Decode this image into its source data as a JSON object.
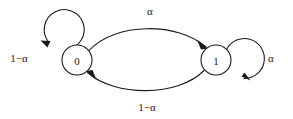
{
  "diagram": {
    "type": "state-transition-diagram",
    "title": "",
    "background_color": "#ffffff",
    "stroke_color": "#1a1a1a",
    "states": [
      {
        "id": "state-0",
        "label": "0",
        "cx": 77,
        "cy": 60,
        "r": 15
      },
      {
        "id": "state-1",
        "label": "1",
        "cx": 216,
        "cy": 60,
        "r": 15
      }
    ],
    "transitions": [
      {
        "id": "transition-0-to-1",
        "from": "0",
        "to": "1",
        "label": "α",
        "label_x": 150,
        "label_y": 11,
        "shape": "upper-arc"
      },
      {
        "id": "transition-1-to-0",
        "from": "1",
        "to": "0",
        "label": "1−α",
        "label_x": 147,
        "label_y": 107,
        "shape": "lower-arc"
      },
      {
        "id": "transition-0-self",
        "from": "0",
        "to": "0",
        "label": "1−α",
        "label_x": 19,
        "label_y": 58,
        "shape": "self-loop-left"
      },
      {
        "id": "transition-1-self",
        "from": "1",
        "to": "1",
        "label": "α",
        "label_x": 271,
        "label_y": 58,
        "shape": "self-loop-right"
      }
    ]
  }
}
